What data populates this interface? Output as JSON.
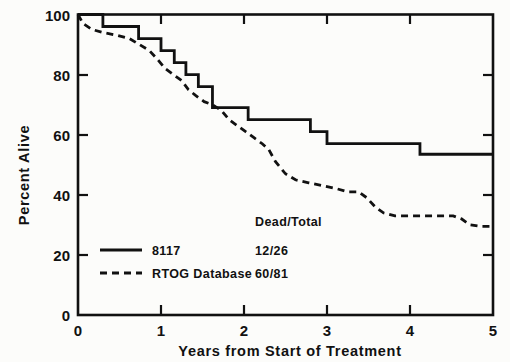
{
  "chart_data": {
    "type": "line",
    "subtype": "kaplan-meier-step",
    "title": "",
    "xlabel": "Years from Start of Treatment",
    "ylabel": "Percent Alive",
    "xlim": [
      0,
      5
    ],
    "ylim": [
      0,
      100
    ],
    "xticks": [
      0,
      1,
      2,
      3,
      4,
      5
    ],
    "xticklabels": [
      "0",
      "1",
      "2",
      "3",
      "4",
      "5"
    ],
    "yticks": [
      0,
      20,
      40,
      60,
      80,
      100
    ],
    "yticklabels": [
      "0",
      "20",
      "40",
      "60",
      "80",
      "100"
    ],
    "grid": false,
    "legend_position": "lower-left-inside",
    "legend_header": "Dead/Total",
    "series": [
      {
        "name": "8117",
        "style": "solid",
        "dead_total": "12/26",
        "points": [
          [
            0.0,
            100
          ],
          [
            0.3,
            100
          ],
          [
            0.3,
            96
          ],
          [
            0.73,
            96
          ],
          [
            0.73,
            92
          ],
          [
            1.0,
            92
          ],
          [
            1.0,
            88
          ],
          [
            1.16,
            88
          ],
          [
            1.16,
            84
          ],
          [
            1.3,
            84
          ],
          [
            1.3,
            80
          ],
          [
            1.45,
            80
          ],
          [
            1.45,
            76
          ],
          [
            1.62,
            76
          ],
          [
            1.62,
            69
          ],
          [
            2.05,
            69
          ],
          [
            2.05,
            65
          ],
          [
            2.8,
            65
          ],
          [
            2.8,
            61
          ],
          [
            3.0,
            61
          ],
          [
            3.0,
            57
          ],
          [
            4.12,
            57
          ],
          [
            4.12,
            53.5
          ],
          [
            5.0,
            53.5
          ]
        ]
      },
      {
        "name": "RTOG Database",
        "style": "dashed",
        "dead_total": "60/81",
        "points": [
          [
            0.0,
            100
          ],
          [
            0.06,
            97
          ],
          [
            0.17,
            95
          ],
          [
            0.3,
            94
          ],
          [
            0.48,
            93
          ],
          [
            0.62,
            92
          ],
          [
            0.74,
            90
          ],
          [
            0.86,
            88
          ],
          [
            0.96,
            85
          ],
          [
            1.05,
            82
          ],
          [
            1.15,
            80
          ],
          [
            1.25,
            78
          ],
          [
            1.33,
            75
          ],
          [
            1.42,
            73
          ],
          [
            1.52,
            71
          ],
          [
            1.62,
            70
          ],
          [
            1.73,
            68
          ],
          [
            1.82,
            65
          ],
          [
            1.92,
            63
          ],
          [
            2.02,
            61
          ],
          [
            2.12,
            59
          ],
          [
            2.22,
            57
          ],
          [
            2.3,
            55
          ],
          [
            2.38,
            51
          ],
          [
            2.5,
            47
          ],
          [
            2.62,
            45
          ],
          [
            2.78,
            44
          ],
          [
            2.95,
            43
          ],
          [
            3.12,
            42
          ],
          [
            3.25,
            41
          ],
          [
            3.38,
            41
          ],
          [
            3.48,
            39
          ],
          [
            3.58,
            36
          ],
          [
            3.68,
            34
          ],
          [
            3.82,
            33
          ],
          [
            3.98,
            33
          ],
          [
            4.25,
            33
          ],
          [
            4.52,
            33
          ],
          [
            4.62,
            32
          ],
          [
            4.72,
            30
          ],
          [
            4.85,
            29.5
          ],
          [
            5.0,
            29.5
          ]
        ]
      }
    ]
  },
  "axes": {
    "y_title": "Percent Alive",
    "x_title": "Years from Start of Treatment",
    "y_tick_labels": [
      "100",
      "80",
      "60",
      "40",
      "20",
      "0"
    ],
    "x_tick_labels": [
      "0",
      "1",
      "2",
      "3",
      "4",
      "5"
    ]
  },
  "legend": {
    "header": "Dead/Total",
    "rows": [
      {
        "label": "8117",
        "value": "12/26",
        "style": "solid"
      },
      {
        "label": "RTOG Database",
        "value": "60/81",
        "style": "dashed"
      }
    ]
  },
  "colors": {
    "ink": "#111111",
    "paper": "#fcfcfa"
  }
}
